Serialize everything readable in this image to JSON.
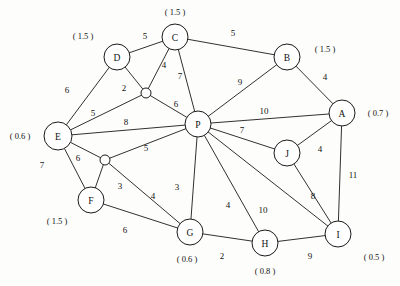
{
  "diagram": {
    "width": 400,
    "height": 286,
    "background_color": "#fdfdfb",
    "line_color": "#1a1a1a",
    "text_color": "#111111"
  },
  "nodes": [
    {
      "id": "A",
      "label": "A",
      "x": 342,
      "y": 113,
      "r": 13,
      "annotation": "( 0.7 )",
      "annotation_x": 378,
      "annotation_y": 113
    },
    {
      "id": "B",
      "label": "B",
      "x": 287,
      "y": 57,
      "r": 13,
      "annotation": "( 1.5 )",
      "annotation_x": 325,
      "annotation_y": 49
    },
    {
      "id": "C",
      "label": "C",
      "x": 175,
      "y": 37,
      "r": 13,
      "annotation": "( 1.5 )",
      "annotation_x": 175,
      "annotation_y": 12
    },
    {
      "id": "D",
      "label": "D",
      "x": 117,
      "y": 57,
      "r": 13,
      "annotation": "( 1.5 )",
      "annotation_x": 83,
      "annotation_y": 36
    },
    {
      "id": "E",
      "label": "E",
      "x": 58,
      "y": 136,
      "r": 14,
      "annotation": "( 0.6 )",
      "annotation_x": 20,
      "annotation_y": 136
    },
    {
      "id": "F",
      "label": "F",
      "x": 91,
      "y": 200,
      "r": 13,
      "annotation": "( 1.5 )",
      "annotation_x": 57,
      "annotation_y": 221
    },
    {
      "id": "G",
      "label": "G",
      "x": 190,
      "y": 232,
      "r": 13,
      "annotation": "( 0.6 )",
      "annotation_x": 187,
      "annotation_y": 259
    },
    {
      "id": "H",
      "label": "H",
      "x": 265,
      "y": 243,
      "r": 13,
      "annotation": "( 0.8 )",
      "annotation_x": 265,
      "annotation_y": 271
    },
    {
      "id": "I",
      "label": "I",
      "x": 338,
      "y": 234,
      "r": 13,
      "annotation": "( 0.5 )",
      "annotation_x": 374,
      "annotation_y": 257
    },
    {
      "id": "J",
      "label": "J",
      "x": 287,
      "y": 153,
      "r": 13,
      "annotation": "",
      "annotation_x": 0,
      "annotation_y": 0
    },
    {
      "id": "P",
      "label": "P",
      "x": 198,
      "y": 124,
      "r": 13,
      "annotation": "",
      "annotation_x": 0,
      "annotation_y": 0
    }
  ],
  "junctions": [
    {
      "id": "j1",
      "label": "",
      "x": 146,
      "y": 93,
      "r": 5
    },
    {
      "id": "j2",
      "label": "",
      "x": 105,
      "y": 160,
      "r": 5
    }
  ],
  "edges": [
    {
      "from": "D",
      "to": "C",
      "weight": "5",
      "label_x": 145,
      "label_y": 36
    },
    {
      "from": "C",
      "to": "B",
      "weight": "5",
      "label_x": 233,
      "label_y": 33
    },
    {
      "from": "D",
      "to": "j1",
      "weight": "2",
      "label_x": 124,
      "label_y": 88
    },
    {
      "from": "C",
      "to": "j1",
      "weight": "4",
      "label_x": 164,
      "label_y": 65
    },
    {
      "from": "C",
      "to": "P",
      "weight": "7",
      "label_x": 180,
      "label_y": 76
    },
    {
      "from": "B",
      "to": "P",
      "weight": "9",
      "label_x": 240,
      "label_y": 82
    },
    {
      "from": "B",
      "to": "A",
      "weight": "4",
      "label_x": 325,
      "label_y": 77
    },
    {
      "from": "D",
      "to": "E",
      "weight": "6",
      "label_x": 67,
      "label_y": 90
    },
    {
      "from": "E",
      "to": "j1",
      "weight": "5",
      "label_x": 93,
      "label_y": 113
    },
    {
      "from": "E",
      "to": "P",
      "weight": "8",
      "label_x": 126,
      "label_y": 122
    },
    {
      "from": "E",
      "to": "F",
      "weight": "6",
      "label_x": 78,
      "label_y": 158
    },
    {
      "from": "E",
      "to": "j2",
      "weight": "7",
      "label_x": 42,
      "label_y": 165
    },
    {
      "from": "j1",
      "to": "P",
      "weight": "6",
      "label_x": 176,
      "label_y": 104
    },
    {
      "from": "P",
      "to": "A",
      "weight": "10",
      "label_x": 264,
      "label_y": 111
    },
    {
      "from": "P",
      "to": "J",
      "weight": "7",
      "label_x": 242,
      "label_y": 130
    },
    {
      "from": "P",
      "to": "j2",
      "weight": "5",
      "label_x": 146,
      "label_y": 148
    },
    {
      "from": "P",
      "to": "G",
      "weight": "3",
      "label_x": 177,
      "label_y": 187
    },
    {
      "from": "P",
      "to": "H",
      "weight": "4",
      "label_x": 228,
      "label_y": 205
    },
    {
      "from": "P",
      "to": "I",
      "weight": "10",
      "label_x": 263,
      "label_y": 210
    },
    {
      "from": "j2",
      "to": "F",
      "weight": "3",
      "label_x": 120,
      "label_y": 186
    },
    {
      "from": "j2",
      "to": "G",
      "weight": "4",
      "label_x": 153,
      "label_y": 196
    },
    {
      "from": "F",
      "to": "G",
      "weight": "6",
      "label_x": 125,
      "label_y": 230
    },
    {
      "from": "G",
      "to": "H",
      "weight": "2",
      "label_x": 222,
      "label_y": 256
    },
    {
      "from": "H",
      "to": "I",
      "weight": "9",
      "label_x": 310,
      "label_y": 256
    },
    {
      "from": "J",
      "to": "A",
      "weight": "4",
      "label_x": 320,
      "label_y": 149
    },
    {
      "from": "J",
      "to": "I",
      "weight": "8",
      "label_x": 313,
      "label_y": 196
    },
    {
      "from": "A",
      "to": "I",
      "weight": "11",
      "label_x": 353,
      "label_y": 175
    }
  ]
}
